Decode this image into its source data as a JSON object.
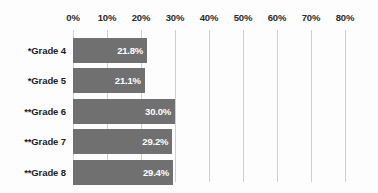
{
  "chart_data": {
    "type": "bar",
    "orientation": "horizontal",
    "title": "",
    "xlabel": "",
    "ylabel": "",
    "categories": [
      "*Grade 4",
      "*Grade 5",
      "**Grade 6",
      "**Grade 7",
      "**Grade 8"
    ],
    "values": [
      21.8,
      21.1,
      30.0,
      29.2,
      29.4
    ],
    "value_labels": [
      "21.8%",
      "21.1%",
      "30.0%",
      "29.2%",
      "29.4%"
    ],
    "xlim": [
      0,
      80
    ],
    "xticks": [
      0,
      10,
      20,
      30,
      40,
      50,
      60,
      70,
      80
    ],
    "xtick_labels": [
      "0%",
      "10%",
      "20%",
      "30%",
      "40%",
      "50%",
      "60%",
      "70%",
      "80%"
    ],
    "xtick_position": "top",
    "grid": "vertical",
    "legend": "none",
    "colors": {
      "bar": "#707070",
      "value_label": "#ffffff",
      "gridline": "#cfcfcf",
      "tick_label": "#2b2b2b",
      "category_label": "#1d1d1d",
      "background": "#fdfdfd"
    }
  }
}
